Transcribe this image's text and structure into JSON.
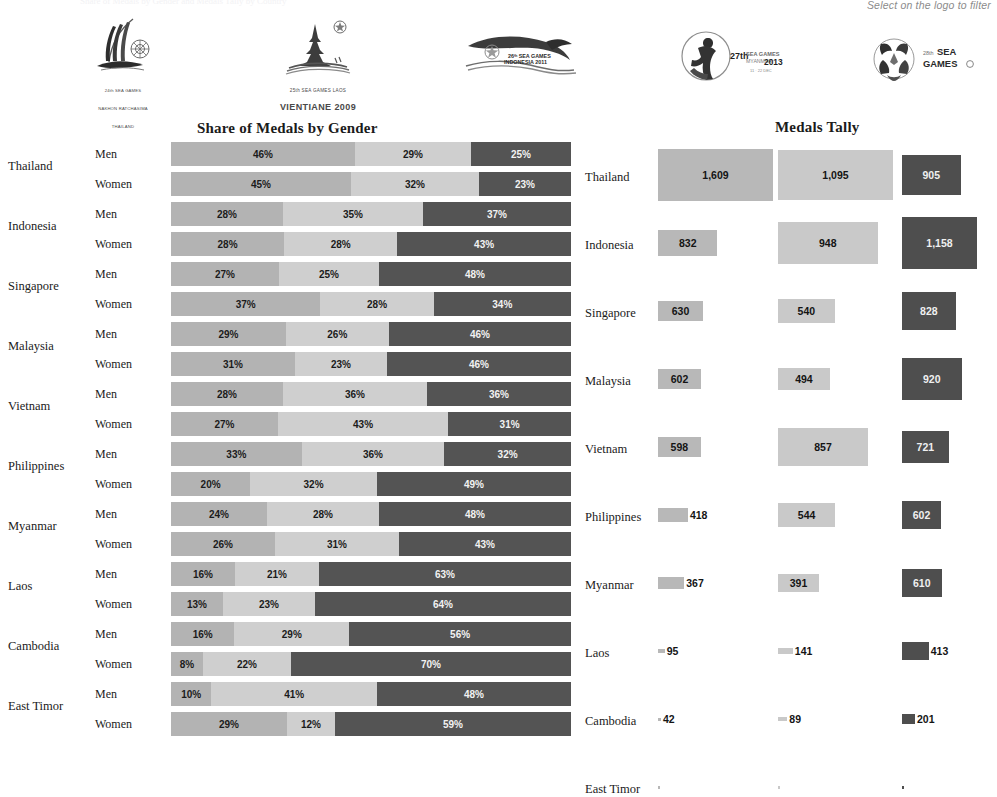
{
  "header": {
    "faint_top_text": "Share of Medals by Gender and Medals Tally by Country",
    "filter_hint": "Select on the logo to filter"
  },
  "logos": [
    {
      "name": "logo-sea-games-2007-thailand",
      "caption_small": "24th SEA GAMES",
      "caption_sub": "NAKHON RATCHASIMA",
      "caption_country": "THAILAND",
      "caption_large": ""
    },
    {
      "name": "logo-sea-games-2009-laos",
      "caption_small": "25th SEA GAMES LAOS",
      "caption_sub": "",
      "caption_country": "",
      "caption_large": "VIENTIANE 2009"
    },
    {
      "name": "logo-sea-games-2011-indonesia",
      "caption_small": "26th SEA GAMES",
      "caption_sub": "INDONESIA 2011",
      "caption_country": "",
      "caption_large": ""
    },
    {
      "name": "logo-sea-games-2013-myanmar",
      "caption_small": "27th SEA GAMES",
      "caption_sub": "MYANMAR",
      "caption_country": "2013",
      "caption_large": ""
    },
    {
      "name": "logo-sea-games-2015-singapore",
      "caption_small": "28th SEA",
      "caption_sub": "GAMES",
      "caption_country": "",
      "caption_large": ""
    }
  ],
  "share": {
    "title": "Share of Medals by Gender",
    "gender_labels": {
      "men": "Men",
      "women": "Women"
    }
  },
  "tally": {
    "title": "Medals Tally"
  },
  "chart_data": {
    "type": "bar",
    "charts": [
      {
        "id": "share-of-medals-by-gender",
        "type": "bar",
        "orientation": "horizontal",
        "stacked": true,
        "title": "Share of Medals by Gender",
        "xlabel": "",
        "ylabel": "",
        "xlim": [
          0,
          100
        ],
        "unit": "%",
        "grid": false,
        "legend": [
          "Gold",
          "Silver",
          "Bronze"
        ],
        "colors": {
          "gold": "#b3b3b3",
          "silver": "#cfcfcf",
          "bronze": "#545454"
        },
        "categories": [
          "Thailand",
          "Indonesia",
          "Singapore",
          "Malaysia",
          "Vietnam",
          "Philippines",
          "Myanmar",
          "Laos",
          "Cambodia",
          "East Timor"
        ],
        "rows": [
          {
            "country": "Thailand",
            "gender": "Men",
            "gold": 46,
            "silver": 29,
            "bronze": 25,
            "labels": [
              "46%",
              "29%",
              "25%"
            ]
          },
          {
            "country": "Thailand",
            "gender": "Women",
            "gold": 45,
            "silver": 32,
            "bronze": 23,
            "labels": [
              "45%",
              "32%",
              "23%"
            ]
          },
          {
            "country": "Indonesia",
            "gender": "Men",
            "gold": 28,
            "silver": 35,
            "bronze": 37,
            "labels": [
              "28%",
              "35%",
              "37%"
            ]
          },
          {
            "country": "Indonesia",
            "gender": "Women",
            "gold": 28,
            "silver": 28,
            "bronze": 43,
            "labels": [
              "28%",
              "28%",
              "43%"
            ]
          },
          {
            "country": "Singapore",
            "gender": "Men",
            "gold": 27,
            "silver": 25,
            "bronze": 48,
            "labels": [
              "27%",
              "25%",
              "48%"
            ]
          },
          {
            "country": "Singapore",
            "gender": "Women",
            "gold": 37,
            "silver": 28,
            "bronze": 34,
            "labels": [
              "37%",
              "28%",
              "34%"
            ]
          },
          {
            "country": "Malaysia",
            "gender": "Men",
            "gold": 29,
            "silver": 26,
            "bronze": 46,
            "labels": [
              "29%",
              "26%",
              "46%"
            ]
          },
          {
            "country": "Malaysia",
            "gender": "Women",
            "gold": 31,
            "silver": 23,
            "bronze": 46,
            "labels": [
              "31%",
              "23%",
              "46%"
            ]
          },
          {
            "country": "Vietnam",
            "gender": "Men",
            "gold": 28,
            "silver": 36,
            "bronze": 36,
            "labels": [
              "28%",
              "36%",
              "36%"
            ]
          },
          {
            "country": "Vietnam",
            "gender": "Women",
            "gold": 27,
            "silver": 43,
            "bronze": 31,
            "labels": [
              "27%",
              "43%",
              "31%"
            ]
          },
          {
            "country": "Philippines",
            "gender": "Men",
            "gold": 33,
            "silver": 36,
            "bronze": 32,
            "labels": [
              "33%",
              "36%",
              "32%"
            ]
          },
          {
            "country": "Philippines",
            "gender": "Women",
            "gold": 20,
            "silver": 32,
            "bronze": 49,
            "labels": [
              "20%",
              "32%",
              "49%"
            ]
          },
          {
            "country": "Myanmar",
            "gender": "Men",
            "gold": 24,
            "silver": 28,
            "bronze": 48,
            "labels": [
              "24%",
              "28%",
              "48%"
            ]
          },
          {
            "country": "Myanmar",
            "gender": "Women",
            "gold": 26,
            "silver": 31,
            "bronze": 43,
            "labels": [
              "26%",
              "31%",
              "43%"
            ]
          },
          {
            "country": "Laos",
            "gender": "Men",
            "gold": 16,
            "silver": 21,
            "bronze": 63,
            "labels": [
              "16%",
              "21%",
              "63%"
            ]
          },
          {
            "country": "Laos",
            "gender": "Women",
            "gold": 13,
            "silver": 23,
            "bronze": 64,
            "labels": [
              "13%",
              "23%",
              "64%"
            ]
          },
          {
            "country": "Cambodia",
            "gender": "Men",
            "gold": 16,
            "silver": 29,
            "bronze": 56,
            "labels": [
              "16%",
              "29%",
              "56%"
            ]
          },
          {
            "country": "Cambodia",
            "gender": "Women",
            "gold": 8,
            "silver": 22,
            "bronze": 70,
            "labels": [
              "8%",
              "22%",
              "70%"
            ]
          },
          {
            "country": "East Timor",
            "gender": "Men",
            "gold": 10,
            "silver": 41,
            "bronze": 48,
            "labels": [
              "10%",
              "41%",
              "48%"
            ]
          },
          {
            "country": "East Timor",
            "gender": "Women",
            "gold": 29,
            "silver": 12,
            "bronze": 59,
            "labels": [
              "29%",
              "12%",
              "59%"
            ]
          }
        ]
      },
      {
        "id": "medals-tally",
        "type": "bar",
        "orientation": "horizontal",
        "stacked": false,
        "title": "Medals Tally",
        "xlabel": "",
        "ylabel": "",
        "grid": false,
        "legend": [
          "Gold",
          "Silver",
          "Bronze"
        ],
        "colors": {
          "gold": "#b8b8b8",
          "silver": "#c9c9c9",
          "bronze": "#4e4e4e"
        },
        "categories": [
          "Thailand",
          "Indonesia",
          "Singapore",
          "Malaysia",
          "Vietnam",
          "Philippines",
          "Myanmar",
          "Laos",
          "Cambodia",
          "East Timor"
        ],
        "series": [
          {
            "name": "Gold",
            "values": [
              1609,
              832,
              630,
              602,
              598,
              418,
              367,
              95,
              42,
              3
            ],
            "labels": [
              "1,609",
              "832",
              "630",
              "602",
              "598",
              "418",
              "367",
              "95",
              "42",
              ""
            ]
          },
          {
            "name": "Silver",
            "values": [
              1095,
              948,
              540,
              494,
              857,
              544,
              391,
              141,
              89,
              4
            ],
            "labels": [
              "1,095",
              "948",
              "540",
              "494",
              "857",
              "544",
              "391",
              "141",
              "89",
              ""
            ]
          },
          {
            "name": "Bronze",
            "values": [
              905,
              1158,
              828,
              920,
              721,
              602,
              610,
              413,
              201,
              12
            ],
            "labels": [
              "905",
              "1,158",
              "828",
              "920",
              "721",
              "602",
              "610",
              "413",
              "201",
              ""
            ]
          }
        ]
      }
    ]
  }
}
